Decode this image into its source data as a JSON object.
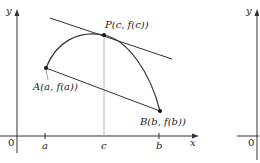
{
  "figure": {
    "main_graph": {
      "axes": {
        "x_label": "x",
        "y_label": "y",
        "origin_label": "0"
      },
      "ticks": [
        {
          "label": "a",
          "x": 45
        },
        {
          "label": "c",
          "x": 104
        },
        {
          "label": "b",
          "x": 159
        }
      ],
      "points": {
        "A": {
          "label": "A(a, f(a))"
        },
        "P": {
          "label": "P(c, f(c))"
        },
        "B": {
          "label": "B(b, f(b))"
        }
      }
    },
    "second_graph": {
      "axes": {
        "y_label": "y",
        "origin_label": "0"
      }
    },
    "colors": {
      "stroke": "#222222",
      "guide": "#999999",
      "background": "#ffffff"
    }
  }
}
